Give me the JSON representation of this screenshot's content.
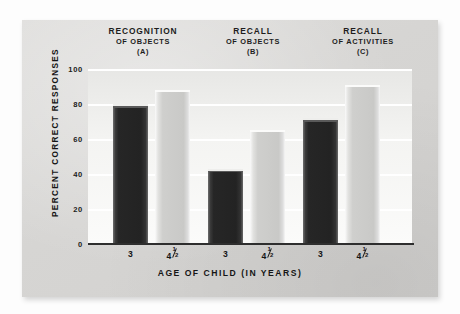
{
  "chart_data": {
    "type": "bar",
    "title": "",
    "xlabel": "AGE OF CHILD (IN YEARS)",
    "ylabel": "PERCENT CORRECT RESPONSES",
    "ylim": [
      0,
      100
    ],
    "yticks": [
      0,
      20,
      40,
      60,
      80,
      100
    ],
    "ytick_labels": [
      "0",
      "20",
      "40",
      "60",
      "80",
      "100"
    ],
    "grid": true,
    "legend": "none",
    "categories": [
      "3",
      "4½"
    ],
    "category_labels": [
      {
        "whole": "3",
        "has_fraction": false,
        "numerator": "",
        "denominator": ""
      },
      {
        "whole": "4",
        "has_fraction": true,
        "numerator": "1",
        "denominator": "2"
      }
    ],
    "groups": [
      {
        "id": "A",
        "title_line1": "RECOGNITION",
        "title_line2": "OF OBJECTS",
        "title_line3": "(A)",
        "values": [
          80,
          88
        ],
        "bars": [
          {
            "age": "3",
            "value": 80,
            "style": "dark"
          },
          {
            "age": "4½",
            "value": 88,
            "style": "light"
          }
        ]
      },
      {
        "id": "B",
        "title_line1": "RECALL",
        "title_line2": "OF OBJECTS",
        "title_line3": "(B)",
        "values": [
          43,
          65
        ],
        "bars": [
          {
            "age": "3",
            "value": 43,
            "style": "dark"
          },
          {
            "age": "4½",
            "value": 65,
            "style": "light"
          }
        ]
      },
      {
        "id": "C",
        "title_line1": "RECALL",
        "title_line2": "OF ACTIVITIES",
        "title_line3": "(C)",
        "values": [
          72,
          91
        ],
        "bars": [
          {
            "age": "3",
            "value": 72,
            "style": "dark"
          },
          {
            "age": "4½",
            "value": 91,
            "style": "light"
          }
        ]
      }
    ],
    "colors": {
      "bar_dark": "#232323",
      "bar_light": "#cfcfcd",
      "card_background": "#d9d9d7",
      "plot_background": "#f4f4f2",
      "gridline": "#ffffff",
      "axis": "#2e2e2e",
      "text": "#151515"
    }
  }
}
